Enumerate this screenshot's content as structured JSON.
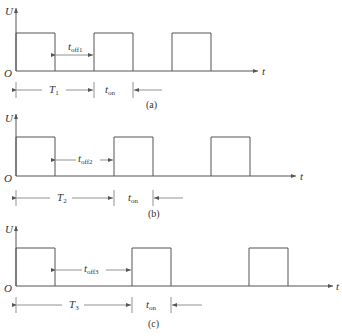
{
  "diagram": {
    "axis_labels": {
      "y": "U",
      "x": "t",
      "origin": "O"
    },
    "panels": [
      {
        "id": "a",
        "caption": "(a)",
        "period_label": {
          "main": "T",
          "sub": "1"
        },
        "off_label": {
          "main": "t",
          "sub": "off1"
        },
        "on_label": {
          "main": "t",
          "sub": "on"
        }
      },
      {
        "id": "b",
        "caption": "(b)",
        "period_label": {
          "main": "T",
          "sub": "2"
        },
        "off_label": {
          "main": "t",
          "sub": "off2"
        },
        "on_label": {
          "main": "t",
          "sub": "on"
        }
      },
      {
        "id": "c",
        "caption": "(c)",
        "period_label": {
          "main": "T",
          "sub": "3"
        },
        "off_label": {
          "main": "t",
          "sub": "off3"
        },
        "on_label": {
          "main": "t",
          "sub": "on"
        }
      }
    ]
  }
}
